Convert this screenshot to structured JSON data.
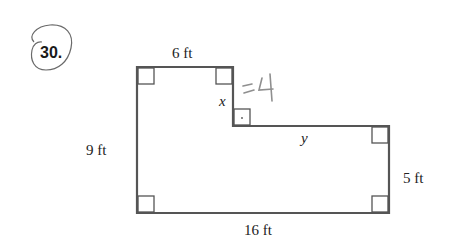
{
  "problem": {
    "number": "30.",
    "circled": true
  },
  "figure": {
    "shape": "L-shaped rectilinear polygon",
    "labels": {
      "top": "6 ft",
      "left": "9 ft",
      "bottom": "16 ft",
      "right": "5 ft",
      "notch_vertical": "x",
      "step_horizontal": "y"
    },
    "handwritten_answer": "=4",
    "right_angle_marks": 7
  },
  "colors": {
    "line": "#555555",
    "text": "#222222",
    "handwriting": "#8a8a8a"
  }
}
